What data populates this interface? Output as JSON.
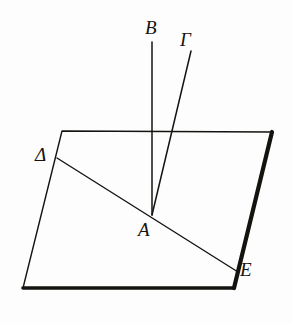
{
  "figure": {
    "background_color": "#fdfdfd",
    "ink_color": "#15130f"
  },
  "labels": {
    "b": "B",
    "gamma": "Γ",
    "delta": "Δ",
    "a": "A",
    "e": "E"
  },
  "chart_data": {
    "type": "line",
    "xlabel": "",
    "ylabel": "",
    "xlim": [
      0,
      293
    ],
    "ylim": [
      323,
      0
    ],
    "grid": false,
    "legend": "none",
    "points": [
      {
        "name": "A",
        "label": "A",
        "x": 152,
        "y": 215
      },
      {
        "name": "B",
        "label": "B",
        "x": 152,
        "y": 42
      },
      {
        "name": "Gamma",
        "label": "Γ",
        "x": 191,
        "y": 51
      },
      {
        "name": "Delta",
        "label": "Δ",
        "x": 57,
        "y": 158
      },
      {
        "name": "E",
        "label": "E",
        "x": 238,
        "y": 272
      },
      {
        "name": "plane-top-left",
        "label": "",
        "x": 62,
        "y": 131
      },
      {
        "name": "plane-top-right",
        "label": "",
        "x": 272,
        "y": 132
      },
      {
        "name": "plane-bottom-right",
        "label": "",
        "x": 234,
        "y": 288
      },
      {
        "name": "plane-bottom-left",
        "label": "",
        "x": 23,
        "y": 288
      }
    ],
    "series": [
      {
        "name": "plane-quadrilateral",
        "kind": "polygon",
        "x": [
          62,
          272,
          234,
          23
        ],
        "y": [
          131,
          132,
          288,
          288
        ],
        "stroke_width": 1.4,
        "closed": true
      },
      {
        "name": "plane-edge-right-bold",
        "kind": "segment",
        "x": [
          272,
          234
        ],
        "y": [
          132,
          288
        ],
        "stroke_width": 4.2
      },
      {
        "name": "plane-edge-bottom-bold",
        "kind": "segment",
        "x": [
          234,
          23
        ],
        "y": [
          288,
          288
        ],
        "stroke_width": 3.6
      },
      {
        "name": "line-delta-e",
        "kind": "segment",
        "x": [
          57,
          238
        ],
        "y": [
          158,
          272
        ],
        "stroke_width": 1.4
      },
      {
        "name": "ray-a-b",
        "kind": "segment",
        "x": [
          152,
          152
        ],
        "y": [
          215,
          42
        ],
        "stroke_width": 1.5
      },
      {
        "name": "ray-a-gamma",
        "kind": "segment",
        "x": [
          152,
          191
        ],
        "y": [
          215,
          51
        ],
        "stroke_width": 1.5
      }
    ],
    "annotations": [
      {
        "text": "B",
        "x": 146,
        "y": 22
      },
      {
        "text": "Γ",
        "x": 181,
        "y": 33
      },
      {
        "text": "Δ",
        "x": 36,
        "y": 147
      },
      {
        "text": "A",
        "x": 139,
        "y": 222
      },
      {
        "text": "E",
        "x": 241,
        "y": 262
      }
    ]
  }
}
